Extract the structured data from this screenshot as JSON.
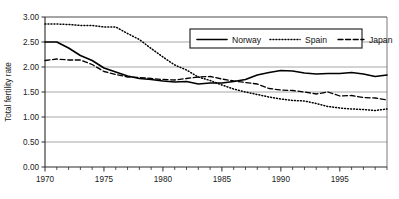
{
  "chart_data": {
    "type": "line",
    "title": "",
    "xlabel": "",
    "ylabel": "Total fertility rate",
    "xlim": [
      1970,
      1999
    ],
    "ylim": [
      0.0,
      3.0
    ],
    "grid": true,
    "legend_position": "top-right",
    "x_tick_labels": [
      "1970",
      "1975",
      "1980",
      "1985",
      "1990",
      "1995"
    ],
    "x_tick_values": [
      1970,
      1975,
      1980,
      1985,
      1990,
      1995
    ],
    "x_minor_ticks_every": 1,
    "y_tick_labels": [
      "0.00",
      "0.50",
      "1.00",
      "1.50",
      "2.00",
      "2.50",
      "3.00"
    ],
    "y_tick_values": [
      0.0,
      0.5,
      1.0,
      1.5,
      2.0,
      2.5,
      3.0
    ],
    "x": [
      1970,
      1971,
      1972,
      1973,
      1974,
      1975,
      1976,
      1977,
      1978,
      1979,
      1980,
      1981,
      1982,
      1983,
      1984,
      1985,
      1986,
      1987,
      1988,
      1989,
      1990,
      1991,
      1992,
      1993,
      1994,
      1995,
      1996,
      1997,
      1998,
      1999
    ],
    "series": [
      {
        "name": "Norway",
        "style": "solid",
        "color": "#000000",
        "values": [
          2.5,
          2.5,
          2.38,
          2.23,
          2.13,
          1.98,
          1.9,
          1.82,
          1.77,
          1.75,
          1.72,
          1.7,
          1.71,
          1.66,
          1.68,
          1.68,
          1.71,
          1.75,
          1.84,
          1.89,
          1.93,
          1.92,
          1.88,
          1.86,
          1.87,
          1.87,
          1.89,
          1.86,
          1.81,
          1.84
        ]
      },
      {
        "name": "Spain",
        "style": "dotted",
        "color": "#000000",
        "values": [
          2.86,
          2.86,
          2.85,
          2.83,
          2.83,
          2.8,
          2.8,
          2.67,
          2.55,
          2.37,
          2.2,
          2.04,
          1.94,
          1.8,
          1.73,
          1.64,
          1.56,
          1.5,
          1.45,
          1.4,
          1.36,
          1.33,
          1.32,
          1.27,
          1.21,
          1.18,
          1.16,
          1.15,
          1.13,
          1.16
        ]
      },
      {
        "name": "Japan",
        "style": "dashed",
        "color": "#000000",
        "values": [
          2.13,
          2.16,
          2.14,
          2.14,
          2.05,
          1.91,
          1.85,
          1.8,
          1.79,
          1.77,
          1.75,
          1.74,
          1.77,
          1.8,
          1.81,
          1.76,
          1.72,
          1.69,
          1.66,
          1.57,
          1.54,
          1.53,
          1.5,
          1.46,
          1.5,
          1.42,
          1.43,
          1.39,
          1.38,
          1.34
        ]
      }
    ]
  },
  "legend": {
    "items": [
      {
        "label": "Norway",
        "style": "solid"
      },
      {
        "label": "Spain",
        "style": "dotted"
      },
      {
        "label": "Japan",
        "style": "dashed"
      }
    ]
  },
  "axes": {
    "y_axis_title": "Total fertility rate"
  },
  "colors": {
    "line": "#000000",
    "grid": "#8f8f8f",
    "frame": "#5a5a5a",
    "background": "#ffffff"
  }
}
